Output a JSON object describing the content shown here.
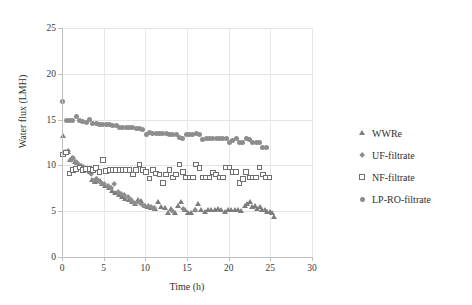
{
  "chart_data": {
    "type": "scatter",
    "title": "",
    "xlabel": "Time (h)",
    "ylabel": "Water flux (LMH)",
    "xlim": [
      0,
      30
    ],
    "ylim": [
      0,
      25
    ],
    "xticks": [
      0,
      5,
      10,
      15,
      20,
      25,
      30
    ],
    "yticks": [
      0,
      5,
      10,
      15,
      20,
      25
    ],
    "grid": true,
    "legend_position": "right",
    "marker_color": "#8d8d8d",
    "series": [
      {
        "name": "WWRe",
        "marker": "triangle",
        "color": "#7d7d7d",
        "points": [
          [
            0.1,
            13.3
          ],
          [
            0.4,
            11.4
          ],
          [
            0.7,
            11.5
          ],
          [
            1.0,
            10.6
          ],
          [
            1.2,
            10.8
          ],
          [
            1.5,
            10.4
          ],
          [
            1.8,
            10.3
          ],
          [
            2.1,
            10.0
          ],
          [
            2.4,
            9.9
          ],
          [
            2.7,
            9.7
          ],
          [
            3.0,
            9.5
          ],
          [
            3.3,
            9.3
          ],
          [
            3.6,
            8.4
          ],
          [
            3.9,
            8.2
          ],
          [
            4.2,
            8.6
          ],
          [
            4.5,
            8.3
          ],
          [
            4.8,
            8.0
          ],
          [
            5.2,
            7.8
          ],
          [
            5.6,
            7.6
          ],
          [
            6.0,
            7.3
          ],
          [
            6.4,
            7.0
          ],
          [
            6.8,
            6.8
          ],
          [
            7.2,
            6.6
          ],
          [
            7.6,
            6.4
          ],
          [
            8.0,
            6.3
          ],
          [
            8.4,
            6.0
          ],
          [
            8.7,
            5.8
          ],
          [
            9.1,
            6.3
          ],
          [
            9.5,
            6.2
          ],
          [
            9.9,
            5.6
          ],
          [
            10.3,
            5.5
          ],
          [
            10.7,
            5.4
          ],
          [
            11.1,
            5.3
          ],
          [
            11.5,
            6.1
          ],
          [
            11.9,
            5.5
          ],
          [
            12.3,
            5.4
          ],
          [
            12.7,
            4.8
          ],
          [
            13.1,
            5.3
          ],
          [
            13.5,
            4.8
          ],
          [
            13.9,
            5.6
          ],
          [
            14.3,
            6.0
          ],
          [
            14.7,
            5.2
          ],
          [
            15.1,
            4.8
          ],
          [
            15.5,
            4.8
          ],
          [
            15.9,
            5.2
          ],
          [
            16.3,
            5.8
          ],
          [
            16.7,
            5.2
          ],
          [
            17.1,
            5.0
          ],
          [
            17.5,
            5.2
          ],
          [
            17.9,
            5.2
          ],
          [
            18.3,
            5.2
          ],
          [
            18.7,
            5.3
          ],
          [
            19.1,
            5.2
          ],
          [
            19.5,
            5.0
          ],
          [
            19.9,
            5.2
          ],
          [
            20.3,
            5.2
          ],
          [
            20.7,
            5.2
          ],
          [
            21.1,
            5.2
          ],
          [
            21.5,
            5.1
          ],
          [
            21.9,
            5.6
          ],
          [
            22.2,
            5.8
          ],
          [
            22.5,
            6.0
          ],
          [
            22.8,
            5.5
          ],
          [
            23.1,
            5.6
          ],
          [
            23.4,
            5.3
          ],
          [
            23.7,
            5.5
          ],
          [
            24.0,
            5.2
          ],
          [
            24.3,
            5.2
          ],
          [
            24.6,
            5.0
          ],
          [
            24.9,
            5.0
          ],
          [
            25.2,
            4.8
          ],
          [
            25.4,
            4.4
          ]
        ]
      },
      {
        "name": "UF-filtrate",
        "marker": "diamond",
        "color": "#8d8d8d",
        "points": [
          [
            0.1,
            11.2
          ],
          [
            0.4,
            11.4
          ],
          [
            0.8,
            11.6
          ],
          [
            1.1,
            10.6
          ],
          [
            1.4,
            10.8
          ],
          [
            1.7,
            10.4
          ],
          [
            2.0,
            10.1
          ],
          [
            2.3,
            9.9
          ],
          [
            2.6,
            9.8
          ],
          [
            2.9,
            9.6
          ],
          [
            3.2,
            9.4
          ],
          [
            3.5,
            9.0
          ],
          [
            3.8,
            8.3
          ],
          [
            4.1,
            8.5
          ],
          [
            4.4,
            8.3
          ],
          [
            4.7,
            8.1
          ],
          [
            5.1,
            7.9
          ],
          [
            5.5,
            7.7
          ],
          [
            5.9,
            7.5
          ],
          [
            6.3,
            8.0
          ],
          [
            6.7,
            7.1
          ],
          [
            7.1,
            6.9
          ],
          [
            7.5,
            6.7
          ],
          [
            7.9,
            6.5
          ],
          [
            8.3,
            6.2
          ],
          [
            8.7,
            5.9
          ],
          [
            9.1,
            6.0
          ],
          [
            9.5,
            5.8
          ],
          [
            9.9,
            5.6
          ],
          [
            10.3,
            5.5
          ],
          [
            10.7,
            5.4
          ],
          [
            11.1,
            5.3
          ],
          [
            13.2,
            5.0
          ],
          [
            14.5,
            5.2
          ],
          [
            16.0,
            5.1
          ]
        ]
      },
      {
        "name": "NF-filtrate",
        "marker": "open-square",
        "color": "#6f6f6f",
        "points": [
          [
            0.1,
            11.2
          ],
          [
            0.5,
            11.4
          ],
          [
            0.9,
            9.1
          ],
          [
            1.3,
            9.5
          ],
          [
            1.7,
            9.6
          ],
          [
            2.1,
            9.8
          ],
          [
            2.5,
            9.5
          ],
          [
            2.9,
            9.6
          ],
          [
            3.3,
            9.6
          ],
          [
            3.7,
            9.5
          ],
          [
            4.1,
            9.7
          ],
          [
            4.5,
            9.3
          ],
          [
            4.9,
            10.6
          ],
          [
            5.3,
            9.4
          ],
          [
            5.7,
            9.5
          ],
          [
            6.1,
            9.5
          ],
          [
            6.5,
            9.5
          ],
          [
            6.9,
            9.5
          ],
          [
            7.3,
            9.5
          ],
          [
            7.7,
            9.5
          ],
          [
            8.1,
            9.5
          ],
          [
            8.5,
            9.0
          ],
          [
            8.9,
            9.5
          ],
          [
            9.3,
            10.1
          ],
          [
            9.7,
            9.5
          ],
          [
            10.1,
            9.3
          ],
          [
            10.5,
            8.6
          ],
          [
            10.9,
            9.5
          ],
          [
            11.3,
            9.1
          ],
          [
            11.7,
            9.0
          ],
          [
            12.1,
            8.1
          ],
          [
            12.5,
            9.0
          ],
          [
            12.9,
            9.5
          ],
          [
            13.3,
            8.7
          ],
          [
            13.7,
            9.0
          ],
          [
            14.1,
            10.1
          ],
          [
            14.5,
            9.3
          ],
          [
            14.9,
            8.7
          ],
          [
            15.3,
            8.7
          ],
          [
            15.7,
            8.7
          ],
          [
            16.1,
            10.1
          ],
          [
            16.5,
            9.7
          ],
          [
            16.9,
            8.7
          ],
          [
            17.3,
            8.7
          ],
          [
            17.7,
            8.7
          ],
          [
            18.1,
            9.2
          ],
          [
            18.5,
            9.0
          ],
          [
            18.9,
            8.7
          ],
          [
            19.3,
            8.7
          ],
          [
            19.7,
            9.8
          ],
          [
            20.1,
            9.8
          ],
          [
            20.5,
            9.3
          ],
          [
            20.9,
            9.3
          ],
          [
            21.3,
            8.1
          ],
          [
            21.7,
            8.5
          ],
          [
            22.1,
            9.3
          ],
          [
            22.5,
            8.7
          ],
          [
            22.9,
            8.7
          ],
          [
            23.3,
            8.7
          ],
          [
            23.7,
            9.8
          ],
          [
            24.1,
            9.0
          ],
          [
            24.5,
            8.7
          ],
          [
            24.9,
            8.7
          ]
        ]
      },
      {
        "name": "LP-RO-filtrate",
        "marker": "circle",
        "color": "#8d8d8d",
        "points": [
          [
            0.1,
            17.0
          ],
          [
            0.5,
            14.9
          ],
          [
            0.9,
            14.9
          ],
          [
            1.3,
            14.9
          ],
          [
            1.7,
            15.3
          ],
          [
            2.1,
            14.9
          ],
          [
            2.5,
            14.8
          ],
          [
            2.9,
            14.7
          ],
          [
            3.3,
            15.0
          ],
          [
            3.7,
            14.6
          ],
          [
            4.1,
            14.6
          ],
          [
            4.5,
            14.5
          ],
          [
            4.9,
            14.5
          ],
          [
            5.3,
            14.5
          ],
          [
            5.7,
            14.5
          ],
          [
            6.1,
            14.4
          ],
          [
            6.5,
            14.4
          ],
          [
            6.9,
            14.1
          ],
          [
            7.3,
            14.1
          ],
          [
            7.7,
            14.1
          ],
          [
            8.1,
            14.1
          ],
          [
            8.5,
            14.1
          ],
          [
            8.9,
            14.0
          ],
          [
            9.3,
            14.0
          ],
          [
            9.7,
            13.9
          ],
          [
            10.1,
            13.4
          ],
          [
            10.5,
            13.6
          ],
          [
            10.9,
            13.5
          ],
          [
            11.3,
            13.5
          ],
          [
            11.7,
            13.5
          ],
          [
            12.1,
            13.5
          ],
          [
            12.5,
            13.5
          ],
          [
            12.9,
            13.4
          ],
          [
            13.3,
            13.4
          ],
          [
            13.7,
            13.4
          ],
          [
            14.1,
            13.0
          ],
          [
            14.5,
            12.9
          ],
          [
            14.9,
            13.4
          ],
          [
            15.3,
            13.4
          ],
          [
            15.7,
            13.4
          ],
          [
            16.1,
            13.5
          ],
          [
            16.5,
            13.4
          ],
          [
            16.9,
            12.8
          ],
          [
            17.3,
            12.9
          ],
          [
            17.7,
            12.9
          ],
          [
            18.1,
            12.9
          ],
          [
            18.5,
            12.9
          ],
          [
            18.9,
            12.9
          ],
          [
            19.3,
            12.9
          ],
          [
            19.7,
            12.9
          ],
          [
            20.1,
            12.5
          ],
          [
            20.5,
            12.7
          ],
          [
            20.9,
            12.9
          ],
          [
            21.3,
            12.5
          ],
          [
            21.7,
            12.5
          ],
          [
            22.1,
            12.9
          ],
          [
            22.5,
            12.8
          ],
          [
            22.9,
            12.5
          ],
          [
            23.3,
            12.5
          ],
          [
            23.7,
            12.5
          ],
          [
            24.1,
            11.9
          ],
          [
            24.5,
            11.9
          ]
        ]
      }
    ]
  },
  "legend": {
    "items": [
      {
        "label": "WWRe",
        "marker": "triangle"
      },
      {
        "label": "UF-filtrate",
        "marker": "diamond"
      },
      {
        "label": "NF-filtrate",
        "marker": "open-square"
      },
      {
        "label": "LP-RO-filtrate",
        "marker": "circle"
      }
    ]
  }
}
